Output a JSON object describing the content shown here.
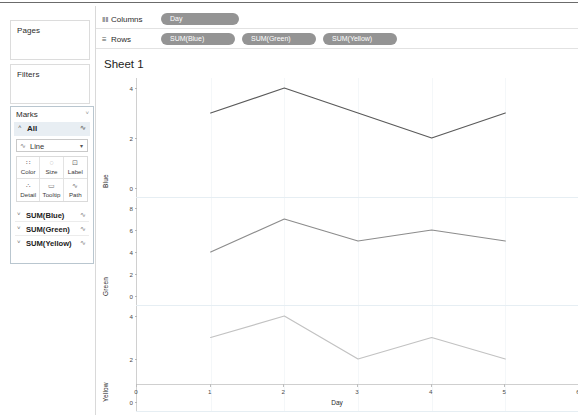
{
  "app": {
    "sheet_title": "Sheet 1"
  },
  "sidebar": {
    "pages": {
      "title": "Pages"
    },
    "filters": {
      "title": "Filters"
    },
    "marks": {
      "title": "Marks",
      "collapse_caret": "˅",
      "all_label": "All",
      "all_chevron": "˄",
      "all_spark": "∿",
      "mark_type": "Line",
      "mark_type_icon": "∿",
      "mark_type_dropdown": "▾",
      "buttons": [
        {
          "label": "Color",
          "glyph": "∷"
        },
        {
          "label": "Size",
          "glyph": "◌"
        },
        {
          "label": "Label",
          "glyph": "⊡"
        },
        {
          "label": "Detail",
          "glyph": "∴"
        },
        {
          "label": "Tooltip",
          "glyph": "▭"
        },
        {
          "label": "Path",
          "glyph": "∿"
        }
      ],
      "fields": [
        {
          "label": "SUM(Blue)",
          "chevron": "˅",
          "spark": "∿"
        },
        {
          "label": "SUM(Green)",
          "chevron": "˅",
          "spark": "∿"
        },
        {
          "label": "SUM(Yellow)",
          "chevron": "˅",
          "spark": "∿"
        }
      ]
    }
  },
  "shelves": {
    "columns": {
      "label": "Columns",
      "icon": "‖‖",
      "pills": [
        "Day"
      ]
    },
    "rows": {
      "label": "Rows",
      "icon": "≡",
      "pills": [
        "SUM(Blue)",
        "SUM(Green)",
        "SUM(Yellow)"
      ]
    }
  },
  "colors": {
    "pill": "#949494",
    "line_blue": "#5a5a5a",
    "line_green": "#8c8c8c",
    "line_yellow": "#c2c2c2",
    "axis": "#cfcfcf",
    "grid": "#f4f7f9"
  },
  "chart_data": {
    "type": "line",
    "title": "Sheet 1",
    "xlabel": "Day",
    "x": [
      1,
      2,
      3,
      4,
      5
    ],
    "xlim": [
      0,
      6
    ],
    "xticks": [
      0,
      1,
      2,
      3,
      4,
      5,
      6
    ],
    "grid": false,
    "legend": "none",
    "panels": [
      {
        "name": "Blue",
        "ylabel": "Blue",
        "series_name": "SUM(Blue)",
        "color": "#5a5a5a",
        "values": [
          3,
          4,
          3,
          2,
          3
        ],
        "ylim": [
          0,
          4
        ],
        "yticks": [
          0,
          2,
          4
        ]
      },
      {
        "name": "Green",
        "ylabel": "Green",
        "series_name": "SUM(Green)",
        "color": "#8c8c8c",
        "values": [
          4,
          7,
          5,
          6,
          5
        ],
        "ylim": [
          0,
          8
        ],
        "yticks": [
          0,
          2,
          4,
          6,
          8
        ]
      },
      {
        "name": "Yellow",
        "ylabel": "Yellow",
        "series_name": "SUM(Yellow)",
        "color": "#c2c2c2",
        "values": [
          3,
          4,
          2,
          3,
          2
        ],
        "ylim": [
          0,
          4
        ],
        "yticks": [
          0,
          2,
          4
        ]
      }
    ]
  }
}
